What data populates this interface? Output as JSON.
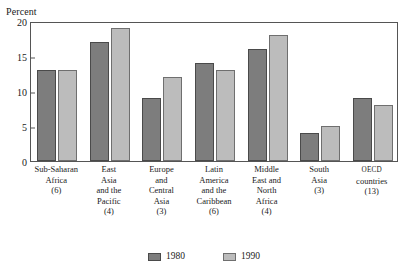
{
  "chart_data": {
    "type": "bar",
    "title": "",
    "xlabel": "",
    "ylabel": "Percent",
    "ylim": [
      0,
      20
    ],
    "yticks": [
      0,
      5,
      10,
      15,
      20
    ],
    "grid": false,
    "legend_position": "bottom",
    "categories": [
      "Sub-Saharan Africa (6)",
      "East Asia and the Pacific (4)",
      "Europe and Central Asia (3)",
      "Latin America and the Caribbean (6)",
      "Middle East and North Africa (4)",
      "South Asia (3)",
      "OECD countries (13)"
    ],
    "category_lines": [
      [
        "Sub-Saharan",
        "Africa",
        "(6)"
      ],
      [
        "East",
        "Asia",
        "and the",
        "Pacific",
        "(4)"
      ],
      [
        "Europe",
        "and",
        "Central",
        "Asia",
        "(3)"
      ],
      [
        "Latin",
        "America",
        "and the",
        "Caribbean",
        "(6)"
      ],
      [
        "Middle",
        "East and",
        "North",
        "Africa",
        "(4)"
      ],
      [
        "South",
        "Asia",
        "(3)"
      ],
      [
        "OECD",
        "countries",
        "(13)"
      ]
    ],
    "series": [
      {
        "name": "1980",
        "color": "#7d7d7d",
        "values": [
          13,
          17,
          9,
          14,
          16,
          4,
          9
        ]
      },
      {
        "name": "1990",
        "color": "#bcbcbc",
        "values": [
          13,
          19,
          12,
          13,
          18,
          5,
          8
        ]
      }
    ]
  },
  "legend": {
    "items": [
      {
        "label": "1980"
      },
      {
        "label": "1990"
      }
    ]
  }
}
